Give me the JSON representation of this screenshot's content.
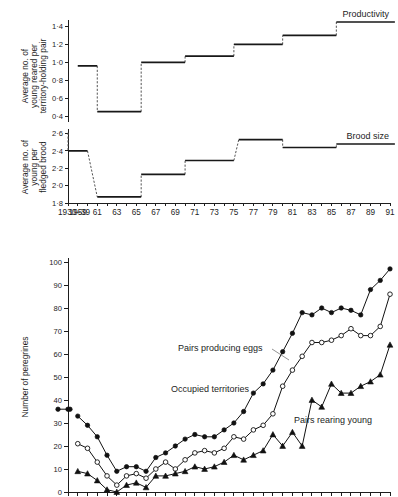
{
  "figure": {
    "caption_top": "Productivity",
    "caption_mid": "Brood size"
  },
  "panels": {
    "productivity": {
      "label": "Productivity",
      "ylabel_line1": "Average no. of",
      "ylabel_line2": "young reared per",
      "ylabel_line3": "territory-holding pair",
      "yticks": [
        "1·4",
        "1·2",
        "1·0",
        "0·8",
        "0·6",
        "0·4"
      ]
    },
    "brood": {
      "label": "Brood size",
      "ylabel_line1": "Average no. of",
      "ylabel_line2": "young per",
      "ylabel_line3": "fledged brood",
      "yticks": [
        "2·6",
        "2·4",
        "2·2",
        "2·0",
        "1·8"
      ]
    },
    "peregrines": {
      "ylabel": "Number of peregrines",
      "yticks": [
        "100",
        "90",
        "80",
        "70",
        "60",
        "50",
        "40",
        "30",
        "20",
        "10",
        "0"
      ],
      "series_labels": {
        "eggs": "Pairs producing eggs",
        "territories": "Occupied territories",
        "young": "Pairs rearing young"
      }
    }
  },
  "xaxis": {
    "labels": [
      "1930–39",
      "1959",
      "61",
      "63",
      "65",
      "67",
      "69",
      "71",
      "73",
      "75",
      "77",
      "79",
      "81",
      "83",
      "85",
      "87",
      "89",
      "91"
    ]
  },
  "chart_data": [
    {
      "type": "line",
      "name": "Productivity (step)",
      "title": "Productivity",
      "xlabel": "",
      "ylabel": "Average no. of young reared per territory-holding pair",
      "ylim": [
        0.4,
        1.45
      ],
      "grid": false,
      "step_segments": [
        {
          "x_start": 1930,
          "x_end": 1959,
          "value": null,
          "style": "none"
        },
        {
          "x_start": 1959,
          "x_end": 1961,
          "value": 0.96,
          "style": "solid"
        },
        {
          "x_start": 1961,
          "x_end": 1965.5,
          "value": 0.45,
          "style": "solid"
        },
        {
          "x_start": 1965.5,
          "x_end": 1970,
          "value": 1.0,
          "style": "solid"
        },
        {
          "x_start": 1970,
          "x_end": 1975,
          "value": 1.07,
          "style": "solid"
        },
        {
          "x_start": 1975,
          "x_end": 1980,
          "value": 1.2,
          "style": "solid"
        },
        {
          "x_start": 1980,
          "x_end": 1985.5,
          "value": 1.3,
          "style": "solid"
        },
        {
          "x_start": 1985.5,
          "x_end": 1991.5,
          "value": 1.45,
          "style": "solid"
        }
      ]
    },
    {
      "type": "line",
      "name": "Brood size (step)",
      "title": "Brood size",
      "xlabel": "",
      "ylabel": "Average no. of young per fledged brood",
      "ylim": [
        1.8,
        2.62
      ],
      "grid": false,
      "step_segments": [
        {
          "x_start": 1930,
          "x_end": 1940,
          "value": 2.61,
          "style": "solid"
        },
        {
          "x_start": 1940,
          "x_end": 1960,
          "value": 2.4,
          "style": "solid"
        },
        {
          "x_start": 1961,
          "x_end": 1965.5,
          "value": 1.87,
          "style": "solid"
        },
        {
          "x_start": 1965.5,
          "x_end": 1970,
          "value": 2.13,
          "style": "solid"
        },
        {
          "x_start": 1970,
          "x_end": 1975,
          "value": 2.29,
          "style": "solid"
        },
        {
          "x_start": 1975.5,
          "x_end": 1980,
          "value": 2.53,
          "style": "solid"
        },
        {
          "x_start": 1980,
          "x_end": 1985.5,
          "value": 2.44,
          "style": "solid"
        },
        {
          "x_start": 1985.5,
          "x_end": 1991.5,
          "value": 2.48,
          "style": "solid"
        }
      ]
    },
    {
      "type": "line",
      "name": "Number of peregrines",
      "title": "",
      "xlabel": "",
      "ylabel": "Number of peregrines",
      "ylim": [
        0,
        100
      ],
      "grid": false,
      "x": [
        1930,
        1959,
        1960,
        1961,
        1962,
        1963,
        1964,
        1965,
        1966,
        1967,
        1968,
        1969,
        1970,
        1971,
        1972,
        1973,
        1974,
        1975,
        1976,
        1977,
        1978,
        1979,
        1980,
        1981,
        1982,
        1983,
        1984,
        1985,
        1986,
        1987,
        1988,
        1989,
        1990,
        1991
      ],
      "series": [
        {
          "name": "Occupied territories",
          "marker": "filled-circle",
          "values": [
            36,
            33,
            29,
            24,
            16,
            9,
            11,
            11,
            9,
            15,
            17,
            20,
            23,
            25,
            24,
            24,
            27,
            30,
            35,
            43,
            47,
            53,
            61,
            69,
            78,
            77,
            80,
            78,
            80,
            79,
            77,
            88,
            92,
            97
          ]
        },
        {
          "name": "Pairs producing eggs",
          "marker": "open-circle",
          "values": [
            null,
            21,
            19,
            13,
            7,
            3,
            7,
            8,
            6,
            10,
            13,
            10,
            14,
            17,
            18,
            17,
            19,
            24,
            23,
            27,
            29,
            34,
            46,
            53,
            59,
            65,
            65,
            66,
            68,
            71,
            68,
            68,
            72,
            86
          ]
        },
        {
          "name": "Pairs rearing young",
          "marker": "filled-tri",
          "values": [
            null,
            9,
            8,
            5,
            1,
            0,
            3,
            4,
            2,
            7,
            7,
            8,
            9,
            11,
            10,
            11,
            13,
            16,
            14,
            16,
            18,
            25,
            20,
            26,
            20,
            40,
            37,
            47,
            43,
            43,
            46,
            48,
            51,
            64
          ]
        }
      ]
    }
  ]
}
